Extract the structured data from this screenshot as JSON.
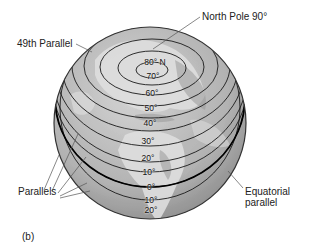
{
  "figure": {
    "panel_tag": "(b)"
  },
  "callouts": {
    "north_pole": "North Pole 90°",
    "parallel_49": "49th Parallel",
    "parallels": "Parallels",
    "equatorial_line1": "Equatorial",
    "equatorial_line2": "parallel"
  },
  "latitude_labels": [
    {
      "label": "80° N",
      "lat": 80,
      "y": 62
    },
    {
      "label": "70°",
      "lat": 70,
      "y": 76
    },
    {
      "label": "60°",
      "lat": 60,
      "y": 93
    },
    {
      "label": "50°",
      "lat": 50,
      "y": 108
    },
    {
      "label": "40°",
      "lat": 40,
      "y": 123
    },
    {
      "label": "30°",
      "lat": 30,
      "y": 141
    },
    {
      "label": "20°",
      "lat": 20,
      "y": 158
    },
    {
      "label": "10°",
      "lat": 10,
      "y": 172
    },
    {
      "label": "0°",
      "lat": 0,
      "y": 187
    },
    {
      "label": "10°",
      "lat": -10,
      "y": 200
    },
    {
      "label": "20°",
      "lat": -20,
      "y": 210
    }
  ],
  "colors": {
    "globe_fill": "#b8b8b8",
    "land": "#d9d9d9",
    "parallel_line": "#1a1a1a",
    "leader_line": "#555555"
  }
}
